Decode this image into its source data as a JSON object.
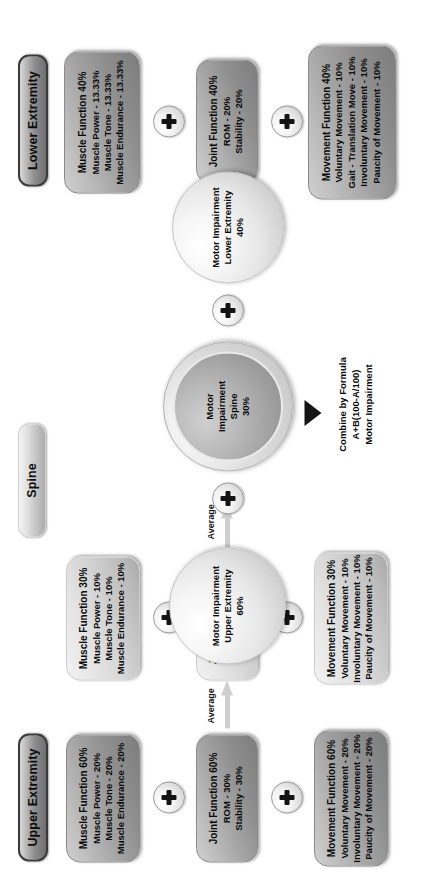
{
  "diagram": {
    "sections": [
      {
        "id": "upper",
        "label": "Upper Extremity"
      },
      {
        "id": "spine",
        "label": "Spine"
      },
      {
        "id": "lower",
        "label": "Lower Extremity"
      }
    ],
    "operators": {
      "plus": "+",
      "average": "Average",
      "arrow": "chevron-right"
    },
    "boxes": {
      "lower_muscle": {
        "name": "lower-extremity-muscle-function",
        "lines": [
          "Muscle Function 40%",
          "Muscle Power - 13.33%",
          "Muscle Tone - 13.33%",
          "Muscle Endurance - 13.33%"
        ]
      },
      "lower_joint": {
        "name": "lower-extremity-joint-function",
        "lines": [
          "Joint Function 40%",
          "ROM - 20%",
          "Stability - 20%"
        ]
      },
      "lower_movement": {
        "name": "lower-extremity-movement-function",
        "lines": [
          "Movement Function 40%",
          "Voluntary Movement - 10%",
          "Gait - Translation Move - 10%",
          "Involuntary Movement - 10%",
          "Paucity of Movement - 10%"
        ]
      },
      "spine_muscle": {
        "name": "spine-muscle-function",
        "lines": [
          "Muscle Function 30%",
          "Muscle Power - 10%",
          "Muscle Tone - 10%",
          "Muscle Endurance - 10%"
        ]
      },
      "spine_joint": {
        "name": "spine-joint-function",
        "lines": [
          "Joint Function 30%",
          "ROM - 15%",
          "Stability - 15%"
        ]
      },
      "spine_movement": {
        "name": "spine-movement-function",
        "lines": [
          "Movement Function 30%",
          "Voluntary Movement - 10%",
          "Involuntary Movement - 10%",
          "Paucity of Movement - 10%"
        ]
      },
      "upper_muscle": {
        "name": "upper-extremity-muscle-function",
        "lines": [
          "Muscle Function 60%",
          "Muscle Power - 20%",
          "Muscle Tone - 20%",
          "Muscle Endurance - 20%"
        ]
      },
      "upper_joint": {
        "name": "upper-extremity-joint-function",
        "lines": [
          "Joint Function 60%",
          "ROM - 30%",
          "Stability - 30%"
        ]
      },
      "upper_movement": {
        "name": "upper-extremity-movement-function",
        "lines": [
          "Movement Function 60%",
          "Voluntary Movement - 20%",
          "Involuntary Movement - 20%",
          "Paucity of Movement - 20%"
        ]
      }
    },
    "spheres": {
      "lower": {
        "l1": "Motor Impairment",
        "l2": "Lower Extremity",
        "l3": "40%"
      },
      "spine": {
        "l1": "Motor",
        "l2": "Impairment",
        "l3": "Spine",
        "l4": "30%"
      },
      "upper": {
        "l1": "Motor Impairment",
        "l2": "Upper Extremity",
        "l3": "60%"
      }
    },
    "formula": {
      "l1": "Combine by Formula",
      "l2": "A+B(100-A/100)",
      "l3": "Motor Impairment"
    },
    "colors": {
      "pill_dark_border": "#3a3a3a",
      "box_grey": "#a4a4a4",
      "box_pale": "#e6e6e6",
      "text": "#0a0a0a"
    }
  }
}
